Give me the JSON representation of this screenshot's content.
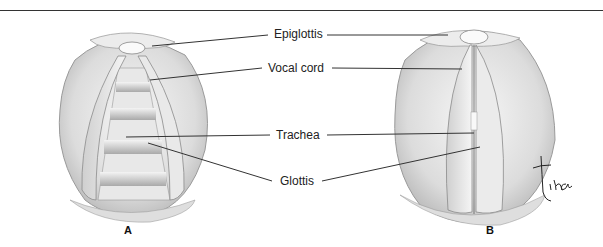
{
  "figure": {
    "labels": {
      "epiglottis": "Epiglottis",
      "vocal_cord": "Vocal cord",
      "trachea": "Trachea",
      "glottis": "Glottis"
    },
    "panels": [
      {
        "letter": "A",
        "description": "Glottis open (abducted vocal cords, trachea visible)"
      },
      {
        "letter": "B",
        "description": "Glottis closed (adducted vocal cords)"
      }
    ],
    "signature": "tina",
    "colors": {
      "line": "#333333",
      "tissue_light": "#f1f1f1",
      "tissue_shade": "#bdbdbd",
      "tissue_dark": "#8a8a8a"
    }
  }
}
